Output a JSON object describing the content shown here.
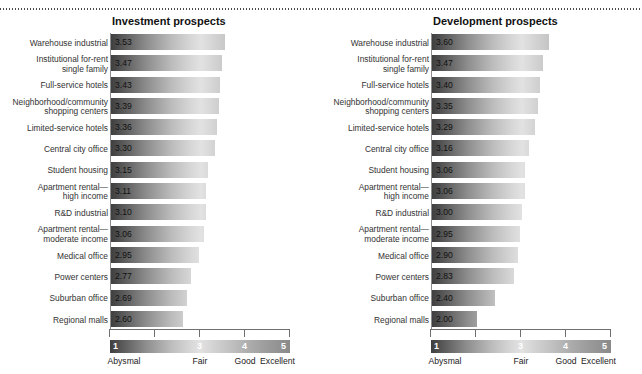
{
  "chart_data": {
    "type": "bar",
    "title": "",
    "xlabel": "",
    "ylabel": "",
    "xlim": [
      1,
      5
    ],
    "grid": false,
    "orientation": "horizontal",
    "axis_ticks": [
      1,
      2,
      3,
      4,
      5
    ],
    "scale_legend": {
      "numbers": [
        "1",
        "3",
        "4",
        "5"
      ],
      "labels": [
        "Abysmal",
        "Fair",
        "Good",
        "Excellent"
      ],
      "label_values": [
        1,
        3,
        4,
        5
      ]
    },
    "categories": [
      "Warehouse industrial",
      "Institutional for-rent\nsingle family",
      "Full-service hotels",
      "Neighborhood/community\nshopping centers",
      "Limited-service hotels",
      "Central city office",
      "Student housing",
      "Apartment rental—\nhigh income",
      "R&D industrial",
      "Apartment rental—\nmoderate income",
      "Medical office",
      "Power centers",
      "Suburban office",
      "Regional malls"
    ],
    "series": [
      {
        "name": "Investment prospects",
        "values": [
          3.53,
          3.47,
          3.43,
          3.39,
          3.36,
          3.3,
          3.15,
          3.11,
          3.1,
          3.06,
          2.95,
          2.77,
          2.69,
          2.6
        ],
        "labels": [
          "3.53",
          "3.47",
          "3.43",
          "3.39",
          "3.36",
          "3.30",
          "3.15",
          "3.11",
          "3.10",
          "3.06",
          "2.95",
          "2.77",
          "2.69",
          "2.60"
        ]
      },
      {
        "name": "Development prospects",
        "values": [
          3.6,
          3.47,
          3.4,
          3.35,
          3.29,
          3.16,
          3.06,
          3.06,
          3.0,
          2.95,
          2.9,
          2.83,
          2.4,
          2.0
        ],
        "labels": [
          "3.60",
          "3.47",
          "3.40",
          "3.35",
          "3.29",
          "3.16",
          "3.06",
          "3.06",
          "3.00",
          "2.95",
          "2.90",
          "2.83",
          "2.40",
          "2.00"
        ]
      }
    ]
  },
  "panels": [
    {
      "title": "Investment prospects",
      "series_index": 0
    },
    {
      "title": "Development prospects",
      "series_index": 1
    }
  ],
  "colors": {
    "gradient_low": "#3f3f3f",
    "gradient_mid": "#e2e2e2",
    "gradient_high": "#8a8a8a",
    "axis": "#6f6f6f",
    "text": "#1a1a1a"
  }
}
